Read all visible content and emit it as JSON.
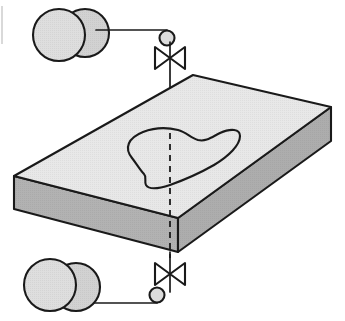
{
  "figure": {
    "caption": "",
    "background_color": "#ffffff"
  },
  "colors": {
    "outline": "#1a1a1a",
    "slab_top_face": "#e8e8e8",
    "slab_front_face": "#b2b2b2",
    "slab_right_face": "#adadad",
    "vessel_fill": "#dedede",
    "vessel_back_fill": "#d2d2d2",
    "node_fill": "#dcdcdc",
    "valve_fill": "#ffffff",
    "scan_artifact": "#c9c9c9"
  },
  "slab": {
    "name": "isometric-plate",
    "label": "",
    "top_face": {
      "name": "plate-top-face",
      "points": "14,176 193,75 331,107 178,218"
    },
    "front_face": {
      "name": "plate-front-face",
      "points": "14,176 178,218 178,252 14,209"
    },
    "right_face": {
      "name": "plate-right-face",
      "points": "178,218 331,107 331,141 178,252"
    },
    "thickness_px": 34
  },
  "region": {
    "name": "kidney-shaped-region",
    "label": "",
    "path": "M 132,158 C 124,148 128,138 143,132 C 156,127 170,128 178,130 C 186,132 191,138 198,140 C 206,142 212,137 220,133 C 231,128 240,129 240,136 C 240,145 229,156 214,165 C 200,173 184,180 170,185 C 158,189 149,190 146,185 C 144,181 147,177 144,174 C 140,170 136,163 132,158 Z"
  },
  "center_line": {
    "name": "vertical-axis-dashed-line",
    "x": 170,
    "y_top": 133,
    "y_bottom": 258,
    "style": "dashed"
  },
  "solid_stem": {
    "name": "vertical-axis-solid-line",
    "x": 170,
    "y_top": 42,
    "y_bottom": 133
  },
  "assemblies": [
    {
      "name": "upper-valve-assembly",
      "position": "above-plate",
      "valve": {
        "name": "gate-valve-symbol-upper",
        "type": "gate-valve",
        "label": "",
        "center_x": 170,
        "center_y": 58,
        "half_width": 15,
        "half_height": 11
      },
      "node": {
        "name": "connection-node-upper",
        "shape": "circle",
        "cx": 167,
        "cy": 38,
        "r": 7.5
      },
      "connector": {
        "name": "connector-line-upper",
        "from_x": 96,
        "from_y": 30,
        "corner_x": 167,
        "corner_y": 30,
        "to_x": 167,
        "to_y": 38
      },
      "vessel_pair": {
        "name": "vessel-pair-upper",
        "label": "",
        "front_circle": {
          "name": "vessel-front-upper",
          "cx": 59,
          "cy": 35,
          "r": 26
        },
        "back_circle": {
          "name": "vessel-back-upper",
          "cx": 85,
          "cy": 33,
          "r": 24
        }
      }
    },
    {
      "name": "lower-valve-assembly",
      "position": "below-plate",
      "valve": {
        "name": "gate-valve-symbol-lower",
        "type": "gate-valve",
        "label": "",
        "center_x": 170,
        "center_y": 274,
        "half_width": 15,
        "half_height": 11
      },
      "node": {
        "name": "connection-node-lower",
        "shape": "circle",
        "cx": 157,
        "cy": 295,
        "r": 7.5
      },
      "connector": {
        "name": "connector-line-lower",
        "from_x": 88,
        "from_y": 303,
        "corner_x": 157,
        "corner_y": 303,
        "to_x": 157,
        "to_y": 295
      },
      "vessel_pair": {
        "name": "vessel-pair-lower",
        "label": "",
        "front_circle": {
          "name": "vessel-front-lower",
          "cx": 50,
          "cy": 285,
          "r": 26
        },
        "back_circle": {
          "name": "vessel-back-lower",
          "cx": 76,
          "cy": 287,
          "r": 24
        }
      }
    }
  ],
  "scan_artifact": {
    "name": "page-edge-artifact",
    "x": 2,
    "y_top": 6,
    "y_bottom": 44
  }
}
